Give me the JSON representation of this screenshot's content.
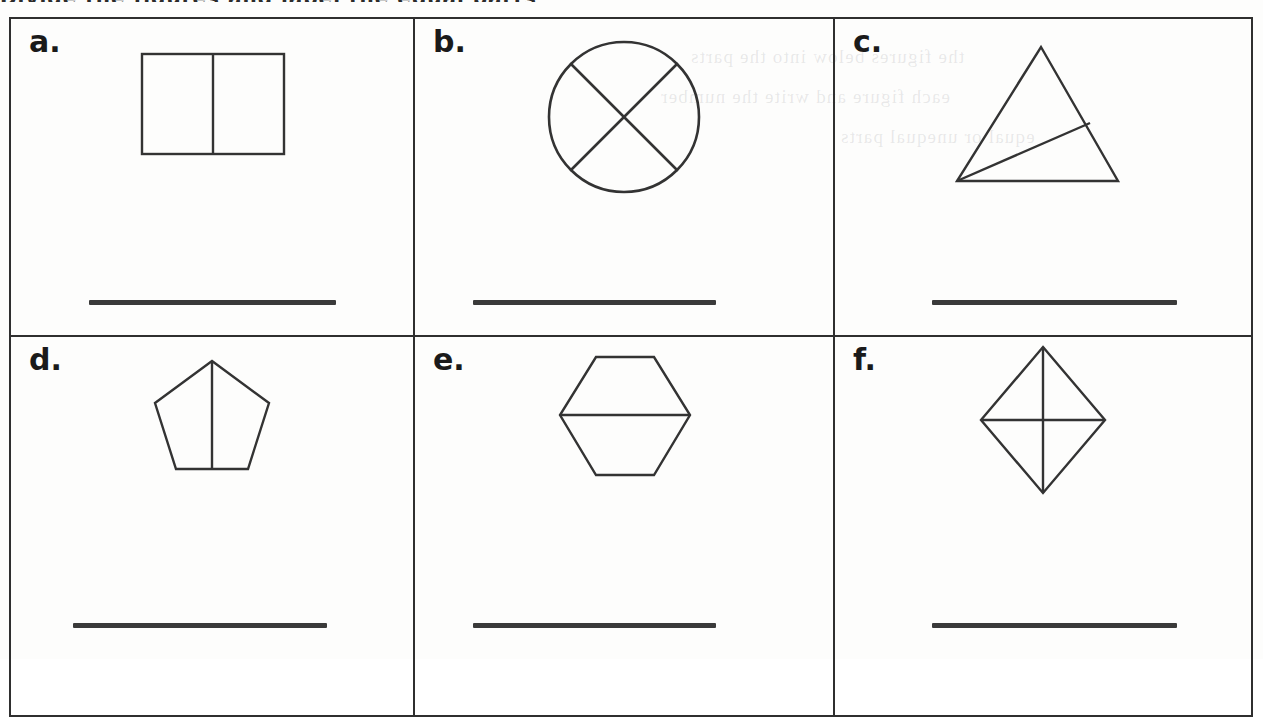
{
  "worksheet": {
    "title_fragment": "Divide the figures and label the equal parts",
    "bleed_text_lines": [
      "the figures below into the parts",
      "each figure and write the number",
      "equal or unequal parts"
    ]
  },
  "grid": {
    "columns": 3,
    "rows": 2,
    "cells": [
      {
        "id": "a",
        "label": "a.",
        "shape": "rectangle",
        "shape_name": "rectangle-split-vertically",
        "parts": 2,
        "equal_parts": true,
        "division": "one vertical line",
        "answer_line": {
          "left": 78,
          "top": 281,
          "width": 247
        }
      },
      {
        "id": "b",
        "label": "b.",
        "shape": "circle",
        "shape_name": "circle-split-by-x",
        "parts": 4,
        "equal_parts": true,
        "division": "two crossing diagonal lines",
        "answer_line": {
          "left": 58,
          "top": 281,
          "width": 243
        }
      },
      {
        "id": "c",
        "label": "c.",
        "shape": "triangle",
        "shape_name": "triangle-split-by-cevian",
        "parts": 2,
        "equal_parts": false,
        "division": "one line from bottom-left vertex to right side",
        "answer_line": {
          "left": 97,
          "top": 281,
          "width": 245
        }
      },
      {
        "id": "d",
        "label": "d.",
        "shape": "pentagon",
        "shape_name": "pentagon-split-vertically",
        "parts": 2,
        "equal_parts": true,
        "division": "one vertical line from top vertex to bottom edge",
        "answer_line": {
          "left": 62,
          "top": 286,
          "width": 254
        }
      },
      {
        "id": "e",
        "label": "e.",
        "shape": "hexagon",
        "shape_name": "hexagon-split-horizontally",
        "parts": 2,
        "equal_parts": true,
        "division": "one horizontal line through side vertices",
        "answer_line": {
          "left": 58,
          "top": 286,
          "width": 243
        }
      },
      {
        "id": "f",
        "label": "f.",
        "shape": "rhombus",
        "shape_name": "rhombus-split-by-diagonals",
        "parts": 4,
        "equal_parts": true,
        "division": "both diagonals",
        "answer_line": {
          "left": 97,
          "top": 286,
          "width": 245
        }
      }
    ]
  },
  "style": {
    "ink_color": "#2f2f2f",
    "shape_stroke": "#333333",
    "answer_line_color": "#3a3a3a",
    "paper_color": "#fdfdfc"
  }
}
